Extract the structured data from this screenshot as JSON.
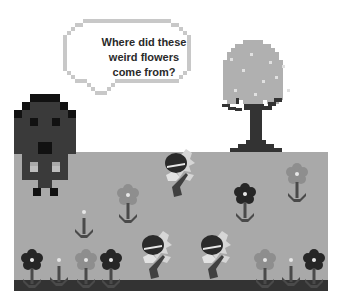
{
  "scene": {
    "speech_bubble": {
      "lines": [
        "Where did these",
        "weird flowers",
        "come from?"
      ]
    },
    "colors": {
      "background": "#ffffff",
      "ground": "#a9a9a9",
      "ground_strip": "#333333",
      "character": "#3a3a3a",
      "character_dark": "#111111",
      "tree_canopy": "#b0b0b0",
      "tree_trunk": "#333333",
      "flower_dark": "#262626",
      "flower_light": "#8e8e8e",
      "stem": "#4a4a4a",
      "bubble_outline": "#c8c8c8"
    }
  }
}
